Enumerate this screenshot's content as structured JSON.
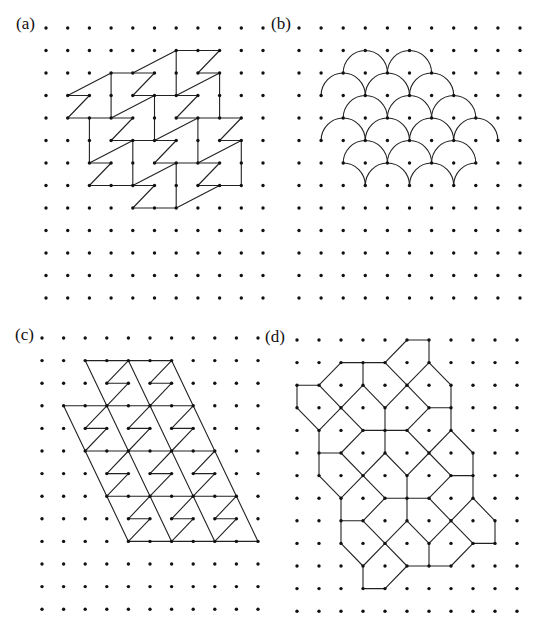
{
  "figure": {
    "panels": [
      {
        "id": "a",
        "label": "(a)",
        "label_pos": [
          16,
          15
        ],
        "grid": {
          "x0": 46,
          "dx": 21.7,
          "y0": 28,
          "dy": 22.5,
          "cols": 11,
          "rows": 13
        },
        "description": "Lattice with Z-shaped tiles",
        "edges": [
          [
            6,
            1,
            8,
            1
          ],
          [
            7,
            2,
            8,
            2
          ],
          [
            3,
            2,
            5,
            2
          ],
          [
            1,
            3,
            2,
            3
          ],
          [
            4,
            3,
            7,
            3
          ],
          [
            1,
            4,
            4,
            4
          ],
          [
            6,
            4,
            9,
            4
          ],
          [
            3,
            5,
            6,
            5
          ],
          [
            8,
            5,
            9,
            5
          ],
          [
            2,
            6,
            3,
            6
          ],
          [
            5,
            6,
            8,
            6
          ],
          [
            2,
            7,
            5,
            7
          ],
          [
            7,
            7,
            9,
            7
          ],
          [
            4,
            8,
            6,
            8
          ],
          [
            6,
            1,
            6,
            3
          ],
          [
            8,
            2,
            8,
            4
          ],
          [
            3,
            2,
            3,
            4
          ],
          [
            5,
            3,
            5,
            5
          ],
          [
            7,
            4,
            7,
            6
          ],
          [
            2,
            4,
            2,
            6
          ],
          [
            4,
            5,
            4,
            7
          ],
          [
            9,
            5,
            9,
            7
          ],
          [
            6,
            6,
            6,
            8
          ],
          [
            4,
            2,
            6,
            1
          ],
          [
            8,
            1,
            7,
            2
          ],
          [
            6,
            3,
            8,
            2
          ],
          [
            5,
            2,
            4,
            3
          ],
          [
            1,
            3,
            3,
            2
          ],
          [
            2,
            3,
            1,
            4
          ],
          [
            3,
            4,
            5,
            3
          ],
          [
            7,
            3,
            6,
            4
          ],
          [
            4,
            4,
            3,
            5
          ],
          [
            5,
            5,
            7,
            4
          ],
          [
            9,
            4,
            8,
            5
          ],
          [
            6,
            5,
            5,
            6
          ],
          [
            7,
            6,
            9,
            5
          ],
          [
            2,
            6,
            4,
            5
          ],
          [
            3,
            6,
            2,
            7
          ],
          [
            8,
            6,
            7,
            7
          ],
          [
            4,
            7,
            6,
            6
          ],
          [
            5,
            7,
            4,
            8
          ],
          [
            6,
            8,
            8,
            7
          ]
        ]
      },
      {
        "id": "b",
        "label": "(b)",
        "label_pos": [
          271,
          15
        ],
        "grid": {
          "x0": 299,
          "dx": 22.1,
          "y0": 28,
          "dy": 22.5,
          "cols": 11,
          "rows": 13
        },
        "description": "Lattice with fish-scale semicircular arcs",
        "arcs_full": [
          [
            3,
            2
          ],
          [
            5,
            2
          ],
          [
            2,
            3
          ],
          [
            4,
            3
          ],
          [
            6,
            3
          ],
          [
            3,
            4
          ],
          [
            5,
            4
          ],
          [
            7,
            4
          ],
          [
            2,
            5
          ],
          [
            4,
            5
          ],
          [
            6,
            5
          ],
          [
            8,
            5
          ],
          [
            3,
            6
          ],
          [
            5,
            6
          ],
          [
            7,
            6
          ],
          [
            4,
            7
          ],
          [
            6,
            7
          ]
        ],
        "arcs_partial": [
          [
            2,
            7,
            "right"
          ],
          [
            8,
            7,
            "left"
          ]
        ]
      },
      {
        "id": "c",
        "label": "(c)",
        "label_pos": [
          15,
          326
        ],
        "grid": {
          "x0": 42,
          "dx": 21.6,
          "y0": 338,
          "dy": 22.6,
          "cols": 11,
          "rows": 13
        },
        "description": "Sheared parallelogram lattice with Z tiles",
        "edges": [
          [
            2,
            1,
            6,
            1
          ],
          [
            1,
            3,
            7,
            3
          ],
          [
            2,
            5,
            8,
            5
          ],
          [
            3,
            7,
            9,
            7
          ],
          [
            4,
            9,
            10,
            9
          ],
          [
            1,
            3,
            4,
            9
          ],
          [
            2,
            1,
            6,
            9
          ],
          [
            4,
            1,
            8,
            9
          ],
          [
            6,
            1,
            10,
            9
          ]
        ],
        "z_anchors": [
          [
            4,
            1
          ],
          [
            6,
            1
          ],
          [
            3,
            3
          ],
          [
            5,
            3
          ],
          [
            7,
            3
          ],
          [
            4,
            5
          ],
          [
            6,
            5
          ],
          [
            8,
            5
          ],
          [
            5,
            7
          ],
          [
            7,
            7
          ],
          [
            9,
            7
          ]
        ]
      },
      {
        "id": "d",
        "label": "(d)",
        "label_pos": [
          265,
          328
        ],
        "grid": {
          "x0": 297,
          "dx": 22,
          "y0": 340,
          "dy": 22.6,
          "cols": 11,
          "rows": 13
        },
        "description": "Lattice with pentagonal tiling",
        "edges": [
          [
            5,
            0,
            6,
            0
          ],
          [
            4,
            1,
            5,
            0
          ],
          [
            6,
            0,
            6,
            1
          ],
          [
            2,
            1,
            4,
            1
          ],
          [
            1,
            2,
            2,
            1
          ],
          [
            3,
            1,
            3,
            2
          ],
          [
            4,
            1,
            5,
            2
          ],
          [
            6,
            1,
            5,
            2
          ],
          [
            6,
            1,
            7,
            2
          ],
          [
            0,
            2,
            1,
            2
          ],
          [
            0,
            2,
            0,
            3
          ],
          [
            1,
            2,
            2,
            3
          ],
          [
            3,
            2,
            2,
            3
          ],
          [
            3,
            2,
            4,
            3
          ],
          [
            5,
            2,
            4,
            3
          ],
          [
            5,
            2,
            6,
            3
          ],
          [
            7,
            2,
            7,
            4
          ],
          [
            6,
            3,
            7,
            3
          ],
          [
            0,
            3,
            1,
            4
          ],
          [
            2,
            3,
            1,
            4
          ],
          [
            2,
            3,
            3,
            4
          ],
          [
            4,
            3,
            4,
            5
          ],
          [
            3,
            4,
            5,
            4
          ],
          [
            6,
            3,
            5,
            4
          ],
          [
            1,
            4,
            1,
            6
          ],
          [
            5,
            4,
            6,
            5
          ],
          [
            7,
            4,
            6,
            5
          ],
          [
            7,
            4,
            8,
            5
          ],
          [
            1,
            5,
            2,
            5
          ],
          [
            3,
            4,
            2,
            5
          ],
          [
            2,
            5,
            3,
            6
          ],
          [
            4,
            5,
            3,
            6
          ],
          [
            4,
            5,
            5,
            6
          ],
          [
            6,
            5,
            5,
            6
          ],
          [
            6,
            5,
            7,
            6
          ],
          [
            8,
            5,
            8,
            7
          ],
          [
            7,
            6,
            8,
            6
          ],
          [
            1,
            6,
            2,
            7
          ],
          [
            3,
            6,
            2,
            7
          ],
          [
            3,
            6,
            4,
            7
          ],
          [
            5,
            6,
            5,
            8
          ],
          [
            4,
            7,
            6,
            7
          ],
          [
            7,
            6,
            6,
            7
          ],
          [
            2,
            7,
            2,
            9
          ],
          [
            2,
            8,
            3,
            8
          ],
          [
            4,
            7,
            3,
            8
          ],
          [
            6,
            7,
            7,
            8
          ],
          [
            8,
            7,
            7,
            8
          ],
          [
            8,
            7,
            9,
            8
          ],
          [
            3,
            8,
            4,
            9
          ],
          [
            5,
            8,
            4,
            9
          ],
          [
            5,
            8,
            6,
            9
          ],
          [
            7,
            8,
            6,
            9
          ],
          [
            7,
            8,
            8,
            9
          ],
          [
            9,
            8,
            9,
            9
          ],
          [
            8,
            9,
            9,
            9
          ],
          [
            2,
            9,
            3,
            10
          ],
          [
            4,
            9,
            3,
            10
          ],
          [
            4,
            9,
            5,
            10
          ],
          [
            6,
            9,
            6,
            10
          ],
          [
            5,
            10,
            7,
            10
          ],
          [
            8,
            9,
            7,
            10
          ],
          [
            3,
            10,
            3,
            11
          ],
          [
            3,
            11,
            4,
            11
          ],
          [
            5,
            10,
            4,
            11
          ]
        ]
      }
    ],
    "colors": {
      "dot": "#111111",
      "edge": "#222222",
      "background": "#ffffff"
    }
  }
}
